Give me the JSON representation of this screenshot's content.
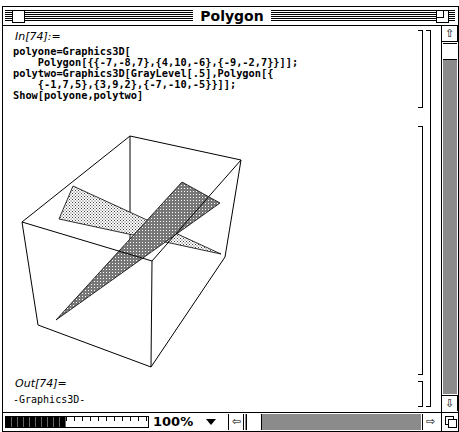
{
  "window": {
    "title": "Polygon"
  },
  "notebook": {
    "input_label": "In[74]:=",
    "input_lines": [
      "polyone=Graphics3D[",
      "    Polygon[{{-7,-8,7},{4,10,-6},{-9,-2,7}}]];",
      "polytwo=Graphics3D[GrayLevel[.5],Polygon[{",
      "    {-1,7,5},{3,9,2},{-7,-10,-5}}]];",
      "Show[polyone,polytwo]"
    ],
    "output_label": "Out[74]=",
    "output_value": "-Graphics3D-"
  },
  "graphic": {
    "description": "3D bounding box with two intersecting triangular polygons",
    "polygons": [
      {
        "name": "polyone",
        "vertices": [
          [
            -7,
            -8,
            7
          ],
          [
            4,
            10,
            -6
          ],
          [
            -9,
            -2,
            7
          ]
        ],
        "fill": "light-stipple"
      },
      {
        "name": "polytwo",
        "vertices": [
          [
            -1,
            7,
            5
          ],
          [
            3,
            9,
            2
          ],
          [
            -7,
            -10,
            -5
          ]
        ],
        "fill": "GrayLevel .5"
      }
    ]
  },
  "statusbar": {
    "zoom_level": "100%"
  },
  "icons": {
    "scroll_up": "⇧",
    "scroll_down": "⇩",
    "scroll_left": "⇦",
    "scroll_right": "⇨"
  }
}
